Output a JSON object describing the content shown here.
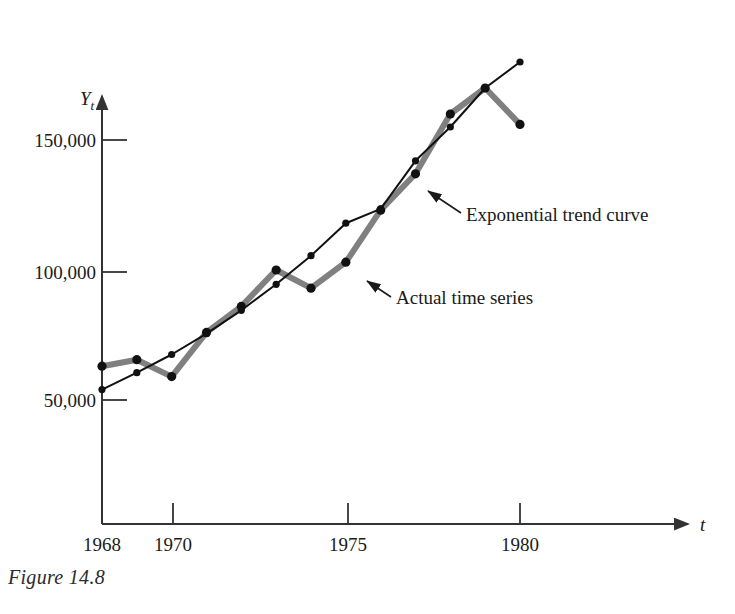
{
  "figure": {
    "caption": "Figure 14.8",
    "y_axis_symbol": "Y",
    "y_axis_subscript": "t",
    "x_axis_symbol": "t"
  },
  "annotations": {
    "trend": "Exponential trend curve",
    "actual": "Actual time series"
  },
  "colors": {
    "actual_series": "#808080",
    "trend_curve": "#111111",
    "axis": "#333333",
    "text": "#1a1a1a",
    "background": "#ffffff"
  },
  "chart_data": {
    "type": "line",
    "title": "",
    "xlabel": "t",
    "ylabel": "Y_t",
    "xlim": [
      1967.3,
      1981.0
    ],
    "ylim": [
      0,
      190000
    ],
    "grid": false,
    "legend_position": "inline-annotations",
    "x": [
      1968,
      1969,
      1970,
      1971,
      1972,
      1973,
      1974,
      1975,
      1976,
      1977,
      1978,
      1979,
      1980
    ],
    "xticks": [
      1968,
      1970,
      1975,
      1980
    ],
    "xticklabels": [
      "1968",
      "1970",
      "1975",
      "1980"
    ],
    "yticks": [
      50000,
      100000,
      150000
    ],
    "yticklabels": [
      "50,000",
      "100,000",
      "150,000"
    ],
    "series": [
      {
        "name": "Actual time series",
        "color": "#808080",
        "marker": "circle",
        "linewidth": 6,
        "values": [
          63000,
          65500,
          59000,
          76000,
          86000,
          100000,
          93000,
          103000,
          123000,
          137000,
          160000,
          170000,
          156000
        ]
      },
      {
        "name": "Exponential trend curve",
        "color": "#111111",
        "marker": "circle",
        "linewidth": 2,
        "values": [
          54000,
          60500,
          67500,
          75500,
          84500,
          94500,
          105500,
          118000,
          123500,
          142000,
          155000,
          170000,
          180000
        ]
      }
    ]
  }
}
